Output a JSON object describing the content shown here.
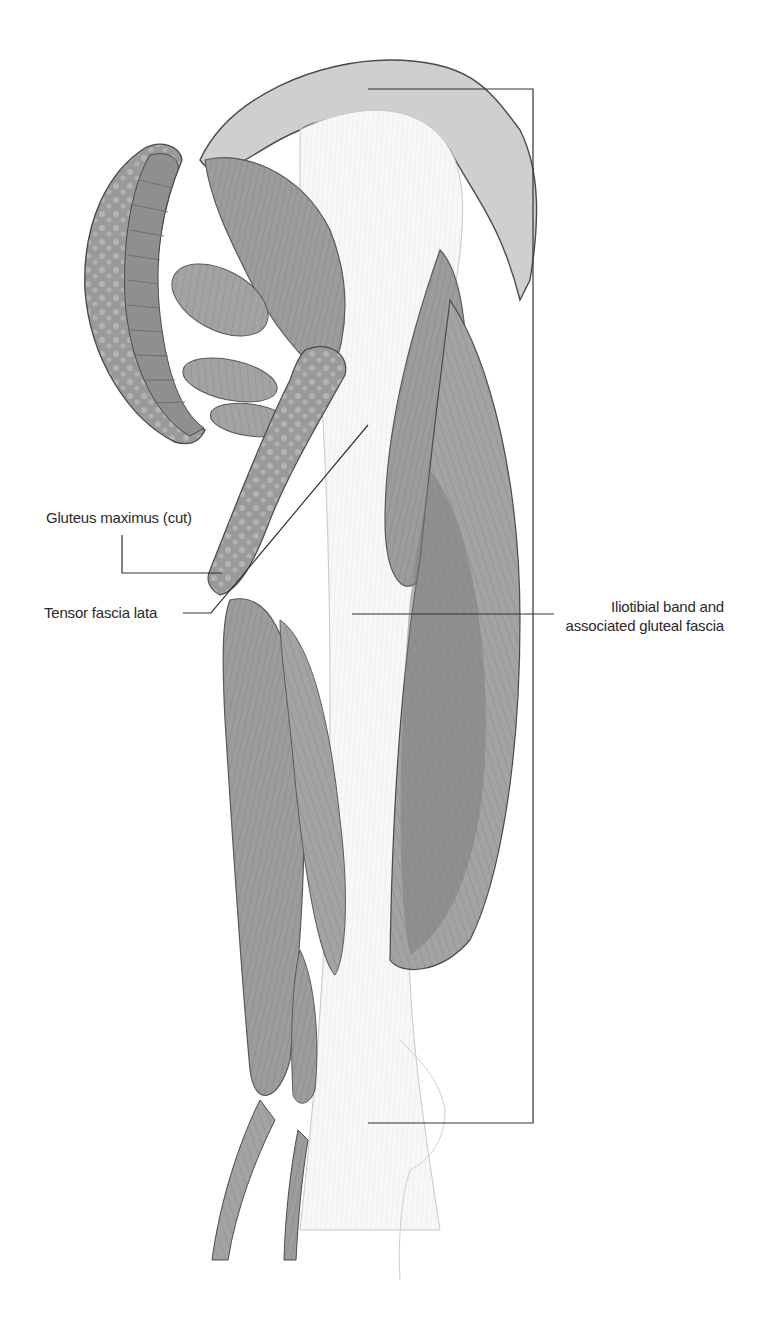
{
  "figure": {
    "colors": {
      "background": "#ffffff",
      "muscle": "#9a9a9a",
      "muscle_dark": "#7d7d7d",
      "muscle_light": "#bdbdbd",
      "fascia": "#f4f4f4",
      "outline": "#4a4a4a",
      "leader_line": "#333333",
      "text": "#2a2a2a"
    }
  },
  "labels": {
    "gluteus_maximus": "Gluteus maximus (cut)",
    "tensor_fascia_lata": "Tensor fascia lata",
    "iliotibial_line1": "Iliotibial band and",
    "iliotibial_line2": "associated gluteal fascia"
  }
}
